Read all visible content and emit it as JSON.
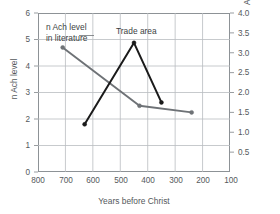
{
  "chart_data": {
    "type": "line",
    "title": "",
    "xlabel": "Years before Christ",
    "ylabel": "n Ach level",
    "ylabel_right": "Athenian trade area in millions of square miles",
    "xlim": [
      800,
      100
    ],
    "x_reversed": true,
    "ylim": [
      0,
      6
    ],
    "ylim_right": [
      0,
      4.0
    ],
    "grid": true,
    "legend_position": "inline-annotations",
    "x_ticks": [
      "800",
      "700",
      "600",
      "500",
      "400",
      "300",
      "200",
      "100"
    ],
    "y_ticks_left": [
      "0",
      "1",
      "2",
      "3",
      "4",
      "5",
      "6"
    ],
    "y_ticks_right": [
      "0.5",
      "1.0",
      "1.5",
      "2.0",
      "2.5",
      "3.0",
      "3.5",
      "4.0"
    ],
    "series": [
      {
        "name": "n Ach level in literature",
        "axis": "left",
        "color": "#6e7276",
        "marker": "circle",
        "points": [
          {
            "x": 710,
            "y": 4.7
          },
          {
            "x": 430,
            "y": 2.5
          },
          {
            "x": 240,
            "y": 2.25
          }
        ]
      },
      {
        "name": "Trade area",
        "axis": "right",
        "color": "#1a1a1a",
        "marker": "circle",
        "points": [
          {
            "x": 630,
            "y": 1.2
          },
          {
            "x": 450,
            "y": 3.25
          },
          {
            "x": 350,
            "y": 1.75
          }
        ]
      }
    ],
    "annotations": [
      {
        "name": "n-ach-annotation",
        "line1": "n  Ach  level",
        "line2": "in literature"
      },
      {
        "name": "trade-area-annotation",
        "line1": "Trade area",
        "line2": ""
      }
    ]
  },
  "axes": {
    "x_title": "Years before Christ",
    "y_left_title": "n Ach level",
    "y_right_title_line1": "Athenian trade area in millions",
    "y_right_title_line2": "of square miles"
  },
  "annotations": {
    "nach_line1": "n  Ach  level",
    "nach_line2": "in literature",
    "trade": "Trade area"
  },
  "ticks": {
    "x": [
      "800",
      "700",
      "600",
      "500",
      "400",
      "300",
      "200",
      "100"
    ],
    "y_left": [
      "6",
      "5",
      "4",
      "3",
      "2",
      "1",
      "0"
    ],
    "y_right": [
      "4.0",
      "3.5",
      "3.0",
      "2.5",
      "2.0",
      "1.5",
      "1.0",
      "0.5"
    ]
  },
  "colors": {
    "series_nach": "#6e7276",
    "series_trade": "#1a1a1a",
    "grid": "#b9bdc0",
    "frame": "#8d9296",
    "text": "#55595c",
    "background": "#ffffff"
  }
}
